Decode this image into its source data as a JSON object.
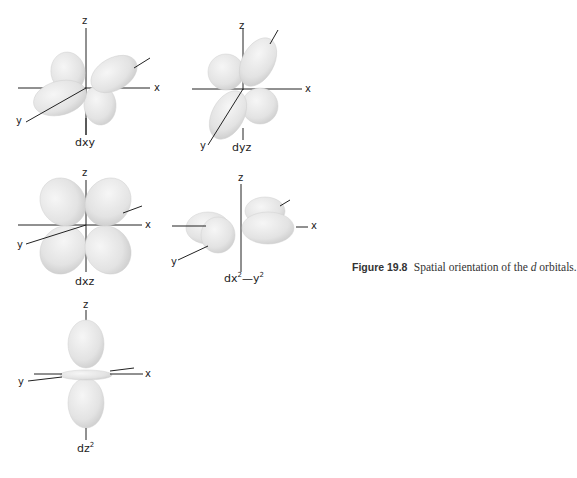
{
  "figure": {
    "number_label": "Figure 19.8",
    "caption_pre": "Spatial orientation of the ",
    "caption_italic": "d",
    "caption_post": " orbitals."
  },
  "axes": {
    "x": "x",
    "y": "y",
    "z": "z"
  },
  "orbitals": [
    {
      "id": "dxy",
      "label": "dxy"
    },
    {
      "id": "dyz",
      "label": "dyz"
    },
    {
      "id": "dxz",
      "label": "dxz"
    },
    {
      "id": "dx2-y2",
      "label_base": "dx",
      "label_sup1": "2",
      "label_mid": "—y",
      "label_sup2": "2"
    },
    {
      "id": "dz2",
      "label_base": "dz",
      "label_sup": "2"
    }
  ],
  "colors": {
    "lobe_fill": "#e4e4e4",
    "lobe_edge": "#cfcfcf",
    "axis": "#222222"
  }
}
